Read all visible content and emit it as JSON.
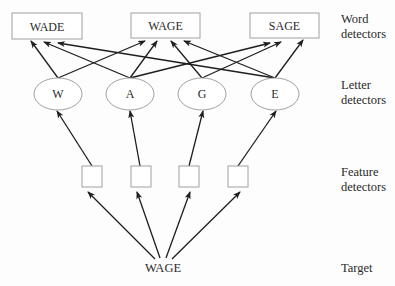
{
  "diagram": {
    "levels": [
      {
        "id": "word",
        "label_line1": "Word",
        "label_line2": "detectors"
      },
      {
        "id": "letter",
        "label_line1": "Letter",
        "label_line2": "detectors"
      },
      {
        "id": "feature",
        "label_line1": "Feature",
        "label_line2": "detectors"
      },
      {
        "id": "target",
        "label_line1": "Target",
        "label_line2": ""
      }
    ],
    "word_nodes": [
      "WADE",
      "WAGE",
      "SAGE"
    ],
    "letter_nodes": [
      "W",
      "A",
      "G",
      "E"
    ],
    "feature_nodes": [
      "",
      "",
      "",
      ""
    ],
    "target": "WAGE",
    "edges": {
      "letter_to_word": [
        {
          "from": "W",
          "to": "WADE"
        },
        {
          "from": "W",
          "to": "WAGE"
        },
        {
          "from": "A",
          "to": "WADE"
        },
        {
          "from": "A",
          "to": "WAGE"
        },
        {
          "from": "A",
          "to": "SAGE"
        },
        {
          "from": "G",
          "to": "WAGE"
        },
        {
          "from": "G",
          "to": "SAGE"
        },
        {
          "from": "E",
          "to": "WADE"
        },
        {
          "from": "E",
          "to": "WAGE"
        },
        {
          "from": "E",
          "to": "SAGE"
        }
      ],
      "feature_to_letter": [
        {
          "from": 0,
          "to": "W"
        },
        {
          "from": 1,
          "to": "A"
        },
        {
          "from": 2,
          "to": "G"
        },
        {
          "from": 3,
          "to": "E"
        }
      ],
      "target_to_feature": [
        0,
        1,
        2,
        3
      ]
    },
    "colors": {
      "node_stroke": "#a0a0a0",
      "arrow": "#1e1e1e",
      "text": "#2a2a2a"
    }
  }
}
